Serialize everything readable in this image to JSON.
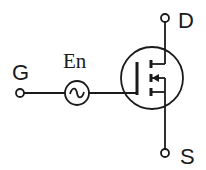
{
  "diagram": {
    "title": "",
    "labels": {
      "gate": "G",
      "drain": "D",
      "source": "S",
      "noise_source": "En"
    },
    "components": [
      {
        "type": "terminal",
        "name": "gate"
      },
      {
        "type": "ac-voltage-source",
        "name": "noise-source",
        "symbol": "~"
      },
      {
        "type": "mosfet",
        "channel": "n",
        "mode": "enhancement"
      },
      {
        "type": "terminal",
        "name": "drain"
      },
      {
        "type": "terminal",
        "name": "source"
      }
    ],
    "colors": {
      "stroke": "#1a1a1a",
      "background": "#ffffff"
    }
  }
}
